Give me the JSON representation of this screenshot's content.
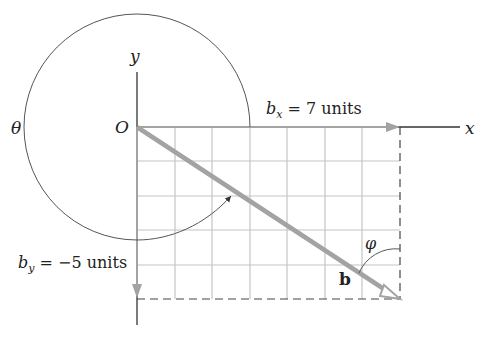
{
  "figure": {
    "labels": {
      "theta": "θ",
      "origin": "O",
      "y_axis": "y",
      "x_axis": "x",
      "bx_symbol": "b",
      "bx_sub": "x",
      "bx_value": " = 7 units",
      "by_symbol": "b",
      "by_sub": "y",
      "by_value": " = −5 units",
      "phi": "φ",
      "vector": "b"
    },
    "components": {
      "bx": 7,
      "by": -5
    },
    "grid": {
      "columns": 7,
      "rows": 5
    },
    "colors": {
      "vector": "#a3a3a3",
      "grid": "#c4c4c4",
      "axis": "#333333",
      "arc": "#555555"
    }
  }
}
